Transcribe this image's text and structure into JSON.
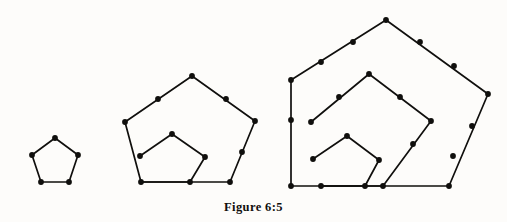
{
  "figure": {
    "caption": "Figure 6:5",
    "background_color": "#fdfcfa",
    "ink_color": "#100f0d",
    "dot_color": "#100f0d",
    "line_width": 1.7,
    "dot_radius": 2.9,
    "panels": [
      {
        "name": "panel-1",
        "label": "first pentagonal number",
        "dot_count": 5,
        "layers": 1,
        "polylines": [
          {
            "name": "pentagon-layer-1",
            "closed": true,
            "points": [
              [
                55,
                138
              ],
              [
                78,
                155
              ],
              [
                69,
                182
              ],
              [
                41,
                182
              ],
              [
                32,
                155
              ]
            ]
          }
        ],
        "dots": [
          [
            55,
            138
          ],
          [
            78,
            155
          ],
          [
            69,
            182
          ],
          [
            41,
            182
          ],
          [
            32,
            155
          ]
        ]
      },
      {
        "name": "panel-2",
        "label": "second pentagonal number",
        "dot_count": 12,
        "layers": 2,
        "polylines": [
          {
            "name": "pentagon-layer-2-outer",
            "closed": false,
            "points": [
              [
                125,
                122
              ],
              [
                141,
                182
              ],
              [
                190,
                182
              ],
              [
                230,
                182
              ],
              [
                255,
                121
              ],
              [
                192,
                76
              ]
            ]
          },
          {
            "name": "pentagon-layer-2-outer-left",
            "closed": false,
            "points": [
              [
                192,
                76
              ],
              [
                125,
                122
              ]
            ]
          },
          {
            "name": "pentagon-layer-1-inner",
            "closed": false,
            "points": [
              [
                140,
                156
              ],
              [
                172,
                134
              ],
              [
                205,
                157
              ],
              [
                190,
                182
              ],
              [
                141,
                182
              ]
            ]
          }
        ],
        "dots": [
          [
            192,
            76
          ],
          [
            158,
            99
          ],
          [
            226,
            99
          ],
          [
            125,
            122
          ],
          [
            255,
            121
          ],
          [
            140,
            156
          ],
          [
            242,
            152
          ],
          [
            141,
            182
          ],
          [
            190,
            182
          ],
          [
            230,
            182
          ],
          [
            172,
            134
          ],
          [
            205,
            157
          ]
        ]
      },
      {
        "name": "panel-3",
        "label": "third pentagonal number",
        "dot_count": 22,
        "layers": 3,
        "polylines": [
          {
            "name": "pentagon-layer-3-outer",
            "closed": false,
            "points": [
              [
                386,
                20
              ],
              [
                488,
                94
              ],
              [
                449,
                186
              ],
              [
                383,
                186
              ],
              [
                321,
                186
              ],
              [
                291,
                186
              ],
              [
                291,
                80
              ]
            ]
          },
          {
            "name": "pentagon-layer-3-outer-left",
            "closed": false,
            "points": [
              [
                291,
                80
              ],
              [
                386,
                20
              ]
            ]
          },
          {
            "name": "pentagon-layer-2-middle",
            "closed": false,
            "points": [
              [
                311,
                122
              ],
              [
                369,
                74
              ],
              [
                431,
                121
              ],
              [
                383,
                186
              ],
              [
                321,
                186
              ]
            ]
          },
          {
            "name": "pentagon-layer-1-inner",
            "closed": false,
            "points": [
              [
                313,
                159
              ],
              [
                347,
                136
              ],
              [
                379,
                160
              ],
              [
                365,
                186
              ],
              [
                321,
                186
              ]
            ]
          }
        ],
        "dots": [
          [
            386,
            20
          ],
          [
            353,
            42
          ],
          [
            420,
            42
          ],
          [
            321,
            62
          ],
          [
            454,
            66
          ],
          [
            291,
            80
          ],
          [
            488,
            94
          ],
          [
            369,
            74
          ],
          [
            339,
            97
          ],
          [
            400,
            97
          ],
          [
            311,
            122
          ],
          [
            431,
            121
          ],
          [
            472,
            126
          ],
          [
            413,
            144
          ],
          [
            291,
            120
          ],
          [
            347,
            136
          ],
          [
            313,
            159
          ],
          [
            379,
            160
          ],
          [
            453,
            156
          ],
          [
            321,
            186
          ],
          [
            383,
            186
          ],
          [
            449,
            186
          ],
          [
            291,
            186
          ],
          [
            365,
            186
          ]
        ]
      }
    ]
  },
  "ghosts": {
    "line1": "",
    "line2": "",
    "line3": ""
  }
}
